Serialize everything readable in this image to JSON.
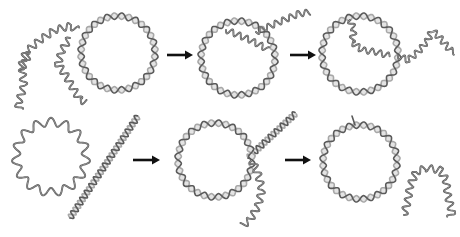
{
  "diagram": {
    "colors": {
      "strand_dark": "#5a5a5a",
      "strand_light": "#a8a8a8",
      "single_strand": "#555555",
      "arrow": "#111111",
      "background": "#ffffff"
    },
    "rows": [
      {
        "name": "top-row",
        "panels": [
          {
            "name": "ssdna-and-circular-dsdna",
            "circles": [
              {
                "type": "double",
                "cx": 118,
                "cy": 53,
                "r": 37,
                "waves": 16
              }
            ],
            "single_strands": [
              {
                "points": [
                  [
                    20,
                    70
                  ],
                  [
                    26,
                    52
                  ],
                  [
                    40,
                    40
                  ],
                  [
                    55,
                    30
                  ],
                  [
                    70,
                    26
                  ],
                  [
                    78,
                    30
                  ]
                ],
                "amp": 3.5,
                "period": 9
              },
              {
                "points": [
                  [
                    30,
                    52
                  ],
                  [
                    22,
                    68
                  ],
                  [
                    24,
                    86
                  ],
                  [
                    18,
                    104
                  ],
                  [
                    20,
                    110
                  ]
                ],
                "amp": 3.5,
                "period": 9
              },
              {
                "points": [
                  [
                    70,
                    38
                  ],
                  [
                    62,
                    50
                  ],
                  [
                    58,
                    64
                  ],
                  [
                    66,
                    76
                  ],
                  [
                    74,
                    90
                  ],
                  [
                    80,
                    100
                  ],
                  [
                    86,
                    102
                  ]
                ],
                "amp": 3.5,
                "period": 9
              }
            ]
          },
          {
            "name": "invasion-intermediate",
            "circles": [
              {
                "type": "double",
                "cx": 238,
                "cy": 58,
                "r": 37,
                "waves": 16
              }
            ],
            "single_strands": [
              {
                "points": [
                  [
                    226,
                    30
                  ],
                  [
                    236,
                    34
                  ],
                  [
                    250,
                    40
                  ],
                  [
                    262,
                    46
                  ],
                  [
                    268,
                    50
                  ]
                ],
                "amp": 3,
                "period": 8
              },
              {
                "points": [
                  [
                    256,
                    32
                  ],
                  [
                    270,
                    26
                  ],
                  [
                    284,
                    20
                  ],
                  [
                    298,
                    14
                  ],
                  [
                    310,
                    12
                  ]
                ],
                "amp": 3,
                "period": 8
              }
            ]
          },
          {
            "name": "displacement-intermediate",
            "circles": [
              {
                "type": "double",
                "cx": 360,
                "cy": 54,
                "r": 38,
                "waves": 16
              }
            ],
            "single_strands": [
              {
                "points": [
                  [
                    350,
                    20
                  ],
                  [
                    354,
                    30
                  ],
                  [
                    352,
                    42
                  ],
                  [
                    362,
                    50
                  ],
                  [
                    376,
                    52
                  ],
                  [
                    390,
                    56
                  ]
                ],
                "amp": 3,
                "period": 8
              },
              {
                "points": [
                  [
                    398,
                    56
                  ],
                  [
                    408,
                    60
                  ],
                  [
                    418,
                    52
                  ],
                  [
                    428,
                    40
                  ],
                  [
                    432,
                    30
                  ],
                  [
                    440,
                    38
                  ],
                  [
                    450,
                    50
                  ],
                  [
                    455,
                    52
                  ]
                ],
                "amp": 3,
                "period": 8
              }
            ]
          }
        ],
        "arrows": [
          {
            "x1": 167,
            "x2": 193,
            "y": 55
          },
          {
            "x1": 290,
            "x2": 316,
            "y": 55
          }
        ]
      },
      {
        "name": "bottom-row",
        "panels": [
          {
            "name": "circular-ssdna-and-linear-dsdna",
            "circles": [
              {
                "type": "single",
                "cx": 51,
                "cy": 157,
                "r": 35,
                "waves": 15
              }
            ],
            "linear_duplex": [
              {
                "x1": 70,
                "y1": 218,
                "x2": 138,
                "y2": 116,
                "waves": 15
              }
            ]
          },
          {
            "name": "annealed-intermediate",
            "circles": [
              {
                "type": "double",
                "cx": 215,
                "cy": 160,
                "r": 37,
                "waves": 16
              }
            ],
            "linear_duplex": [
              {
                "x1": 248,
                "y1": 158,
                "x2": 296,
                "y2": 113,
                "waves": 8
              }
            ],
            "single_strands": [
              {
                "points": [
                  [
                    252,
                    160
                  ],
                  [
                    258,
                    174
                  ],
                  [
                    262,
                    190
                  ],
                  [
                    258,
                    206
                  ],
                  [
                    250,
                    220
                  ],
                  [
                    242,
                    226
                  ]
                ],
                "amp": 3.5,
                "period": 9
              }
            ]
          },
          {
            "name": "product-circular-dsdna-and-released-ssdna",
            "circles": [
              {
                "type": "double",
                "cx": 360,
                "cy": 162,
                "r": 37,
                "waves": 16
              }
            ],
            "tails": [
              {
                "points": [
                  [
                    355,
                    125
                  ],
                  [
                    352,
                    116
                  ]
                ]
              }
            ],
            "single_strands": [
              {
                "points": [
                  [
                    404,
                    215
                  ],
                  [
                    408,
                    200
                  ],
                  [
                    410,
                    186
                  ],
                  [
                    416,
                    172
                  ],
                  [
                    426,
                    168
                  ],
                  [
                    440,
                    170
                  ],
                  [
                    446,
                    180
                  ],
                  [
                    448,
                    196
                  ],
                  [
                    452,
                    212
                  ],
                  [
                    450,
                    218
                  ]
                ],
                "amp": 3.5,
                "period": 9
              }
            ]
          }
        ],
        "arrows": [
          {
            "x1": 133,
            "x2": 160,
            "y": 160
          },
          {
            "x1": 285,
            "x2": 311,
            "y": 160
          }
        ]
      }
    ]
  }
}
